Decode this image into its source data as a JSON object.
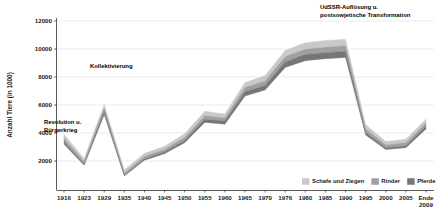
{
  "chart_data": {
    "type": "area",
    "title": "",
    "subtitle": "",
    "xlabel": "",
    "ylabel": "Anzahl Tiere (in 1000)",
    "ylim": [
      0,
      12000
    ],
    "ytick_values": [
      2000,
      4000,
      6000,
      8000,
      10000,
      12000
    ],
    "ytick_labels": [
      "2000",
      "4000",
      "6000",
      "8000",
      "10000",
      "12000"
    ],
    "grid": true,
    "legend_position": "bottom-right",
    "x": [
      1916,
      1923,
      1929,
      1935,
      1940,
      1945,
      1950,
      1955,
      1960,
      1965,
      1970,
      1976,
      1980,
      1985,
      1990,
      1995,
      2000,
      2005,
      2009
    ],
    "xtick_labels": [
      "1916",
      "1923",
      "1929",
      "1935",
      "1940",
      "1945",
      "1950",
      "1955",
      "1960",
      "1965",
      "1970",
      "1976",
      "1980",
      "1985",
      "1990",
      "1995",
      "2000",
      "2005",
      "Ende 2009"
    ],
    "series": [
      {
        "name": "Schafe und Ziegen",
        "color": "#c9c9c9",
        "values": [
          3900,
          2180,
          6050,
          1350,
          2550,
          3050,
          3950,
          5550,
          5350,
          7600,
          8100,
          9900,
          10450,
          10600,
          10700,
          4600,
          3400,
          3550,
          5000
        ]
      },
      {
        "name": "Rinder",
        "color": "#a0a0a0",
        "values": [
          3620,
          1960,
          5780,
          1150,
          2330,
          2830,
          3680,
          5240,
          5080,
          7250,
          7720,
          9450,
          9980,
          10120,
          10230,
          4290,
          3150,
          3300,
          4720
        ]
      },
      {
        "name": "Pferde",
        "color": "#767676",
        "values": [
          3350,
          1780,
          5560,
          980,
          2150,
          2640,
          3460,
          4980,
          4850,
          6950,
          7400,
          9080,
          9600,
          9740,
          9840,
          4030,
          2950,
          3080,
          4480
        ]
      }
    ],
    "annotations": [
      {
        "id": "revolution",
        "text_line1": "Revolution u.",
        "text_line2": "Bürgerkrieg"
      },
      {
        "id": "kollektivierung",
        "text_line1": "Kollektivierung",
        "text_line2": ""
      },
      {
        "id": "udssr",
        "text_line1": "UdSSR-Auflösung u.",
        "text_line2": "postsowjetische Transformation"
      }
    ]
  }
}
